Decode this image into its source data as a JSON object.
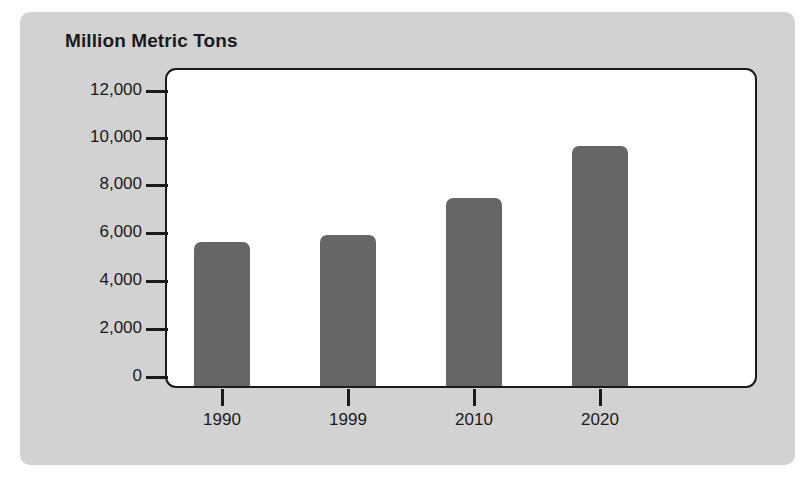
{
  "chart_data": {
    "type": "bar",
    "title": "Million Metric Tons",
    "xlabel": "",
    "ylabel": "Million Metric Tons",
    "categories": [
      "1990",
      "1999",
      "2010",
      "2020"
    ],
    "values": [
      5650,
      5950,
      7500,
      9700
    ],
    "ylim": [
      0,
      13000
    ],
    "yticks": [
      0,
      2000,
      4000,
      6000,
      8000,
      10000,
      12000
    ],
    "ytick_labels": [
      "0",
      "2,000",
      "4,000",
      "6,000",
      "8,000",
      "10,000",
      "12,000"
    ],
    "grid": false,
    "legend": "none",
    "series": [
      {
        "name": "Million Metric Tons",
        "values": [
          5650,
          5950,
          7500,
          9700
        ]
      }
    ],
    "colors": {
      "bar_fill": "#666666",
      "panel_background": "#d2d2d2",
      "plot_background": "#ffffff",
      "axis_line": "#1a1a1a",
      "text": "#1a1a1a"
    }
  },
  "axis": {
    "y_ticks": [
      {
        "label": "12,000",
        "value": 12000
      },
      {
        "label": "10,000",
        "value": 10000
      },
      {
        "label": "8,000",
        "value": 8000
      },
      {
        "label": "6,000",
        "value": 6000
      },
      {
        "label": "4,000",
        "value": 4000
      },
      {
        "label": "2,000",
        "value": 2000
      },
      {
        "label": "0",
        "value": 0
      }
    ],
    "x_ticks": [
      {
        "label": "1990"
      },
      {
        "label": "1999"
      },
      {
        "label": "2010"
      },
      {
        "label": "2020"
      }
    ]
  }
}
